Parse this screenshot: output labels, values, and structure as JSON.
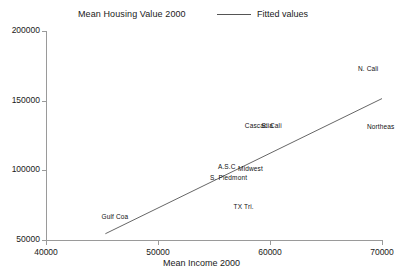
{
  "chart_data": {
    "type": "scatter",
    "title": "Mean Housing Value 2000",
    "xlabel": "Mean Income 2000",
    "ylabel": "",
    "xlim": [
      40000,
      70000
    ],
    "ylim": [
      50000,
      200000
    ],
    "xticks": [
      "40000",
      "50000",
      "60000",
      "70000"
    ],
    "yticks": [
      "50000",
      "100000",
      "150000",
      "200000"
    ],
    "grid": false,
    "legend": {
      "position": "top-right",
      "entries": [
        {
          "label": "Fitted values",
          "type": "line",
          "color": "#555555"
        }
      ]
    },
    "point_labels": [
      {
        "text": "N. Cali",
        "x": 69100,
        "y": 173000
      },
      {
        "text": "Northeas",
        "x": 69900,
        "y": 131000
      },
      {
        "text": "Cascadia",
        "x": 59000,
        "y": 131500
      },
      {
        "text": "S. Cali",
        "x": 60500,
        "y": 131500
      },
      {
        "text": "Midwest",
        "x": 58400,
        "y": 101000
      },
      {
        "text": "A.S.C",
        "x": 56600,
        "y": 102500
      },
      {
        "text": "S. Piedmont",
        "x": 55900,
        "y": 94500
      },
      {
        "text": "TX Tri.",
        "x": 58000,
        "y": 73500
      },
      {
        "text": "Gulf Coa",
        "x": 46200,
        "y": 66500
      }
    ],
    "fit_line": {
      "name": "Fitted values",
      "color": "#555555",
      "x": [
        45300,
        70000
      ],
      "y": [
        54500,
        151500
      ]
    }
  }
}
